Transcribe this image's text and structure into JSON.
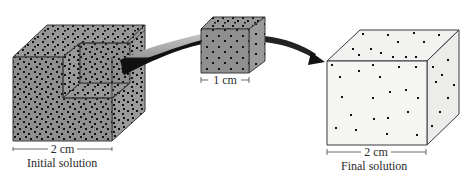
{
  "colors": {
    "concentrated_face": "#8f8f8f",
    "concentrated_side": "#9a9a9a",
    "concentrated_top": "#979797",
    "dilute_face": "#f3f3f1",
    "dilute_side": "#eeeeec",
    "edge": "#3a3a3a",
    "particle": "#111111",
    "arrow_light": "#b4b4b4",
    "arrow_dark": "#111111"
  },
  "initial": {
    "dimension_label": "2 cm",
    "caption": "Initial solution"
  },
  "sample": {
    "dimension_label": "1 cm"
  },
  "final": {
    "dimension_label": "2 cm",
    "caption": "Final solution"
  }
}
